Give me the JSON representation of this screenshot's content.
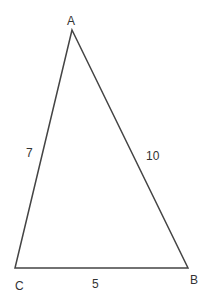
{
  "diagram": {
    "type": "triangle",
    "stroke_color": "#444444",
    "label_color": "#333333",
    "vertices": [
      {
        "name": "A",
        "label": "A",
        "x": 72,
        "y": 30,
        "label_x": 67,
        "label_y": 25
      },
      {
        "name": "B",
        "label": "B",
        "x": 188,
        "y": 268,
        "label_x": 190,
        "label_y": 284
      },
      {
        "name": "C",
        "label": "C",
        "x": 15,
        "y": 268,
        "label_x": 15,
        "label_y": 290
      }
    ],
    "sides": [
      {
        "name": "AC",
        "label": "7",
        "label_x": 26,
        "label_y": 157
      },
      {
        "name": "AB",
        "label": "10",
        "label_x": 146,
        "label_y": 160
      },
      {
        "name": "CB",
        "label": "5",
        "label_x": 92,
        "label_y": 288
      }
    ]
  }
}
